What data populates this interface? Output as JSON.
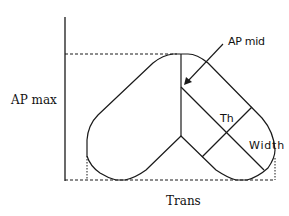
{
  "diagram": {
    "type": "morphology schematic",
    "labels": {
      "y_axis": "AP max",
      "x_axis": "Trans",
      "apex_arrow": "AP mid",
      "inner_measure_1": "Th",
      "inner_measure_2": "Width"
    },
    "colors": {
      "line": "#1a1a1a",
      "background": "#ffffff"
    }
  }
}
